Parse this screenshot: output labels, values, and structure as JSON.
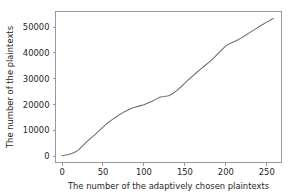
{
  "chart_data": {
    "type": "line",
    "title": "",
    "xlabel": "The number of the adaptively chosen plaintexts",
    "ylabel": "The number of the plaintexts",
    "xlim": [
      -8,
      268
    ],
    "ylim": [
      -2400,
      56000
    ],
    "xticks": [
      0,
      50,
      100,
      150,
      200,
      250
    ],
    "xtick_labels": [
      "0",
      "50",
      "100",
      "150",
      "200",
      "250"
    ],
    "yticks": [
      0,
      10000,
      20000,
      30000,
      40000,
      50000
    ],
    "ytick_labels": [
      "0",
      "10000",
      "20000",
      "30000",
      "40000",
      "50000"
    ],
    "grid": false,
    "legend": null,
    "line_color": "#6e6e6e",
    "axis_color": "#9a9a9a",
    "text_color": "#262626",
    "background": "#ffffff",
    "series": [
      {
        "name": "plaintexts",
        "x": [
          0,
          5,
          10,
          15,
          20,
          25,
          30,
          35,
          40,
          45,
          50,
          55,
          60,
          65,
          70,
          75,
          80,
          85,
          90,
          95,
          100,
          105,
          110,
          115,
          120,
          125,
          130,
          135,
          140,
          145,
          150,
          155,
          160,
          165,
          170,
          175,
          180,
          185,
          190,
          195,
          200,
          205,
          210,
          215,
          220,
          225,
          230,
          235,
          240,
          245,
          250,
          255,
          258
        ],
        "y": [
          200,
          500,
          900,
          1500,
          2400,
          4000,
          5600,
          7000,
          8300,
          9800,
          11300,
          12700,
          13900,
          15000,
          16100,
          17000,
          17800,
          18600,
          19100,
          19500,
          19900,
          20600,
          21300,
          22100,
          22900,
          23100,
          23400,
          24200,
          25400,
          26800,
          28300,
          29800,
          31200,
          32600,
          33900,
          35200,
          36500,
          37900,
          39600,
          41200,
          42700,
          43600,
          44300,
          45100,
          46000,
          47000,
          48000,
          49000,
          50000,
          51000,
          51900,
          52800,
          53300
        ]
      }
    ]
  },
  "figure": {
    "plot_area": {
      "left": 55.5,
      "top": 11.5,
      "right": 281.5,
      "bottom": 162.5
    }
  }
}
